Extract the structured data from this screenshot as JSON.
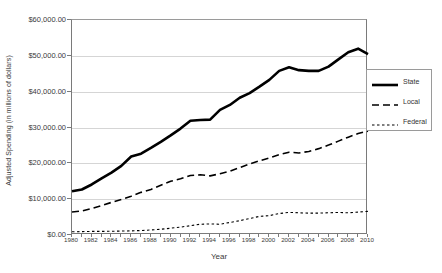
{
  "chart_data": {
    "type": "line",
    "title": "",
    "xlabel": "Year",
    "ylabel": "Adjusted Spending (in millions of dollars)",
    "xlim": [
      1980,
      2010
    ],
    "ylim": [
      0,
      60000
    ],
    "grid": true,
    "legend_position": "right",
    "y_tick_labels": [
      "$60,000.00",
      "$50,000.00",
      "$40,000.00",
      "$30,000.00",
      "$20,000.00",
      "$10,000.00",
      "$0.00"
    ],
    "y_tick_values": [
      60000,
      50000,
      40000,
      30000,
      20000,
      10000,
      0
    ],
    "x_tick_labels": [
      "1980",
      "1982",
      "1984",
      "1986",
      "1988",
      "1990",
      "1992",
      "1994",
      "1996",
      "1998",
      "2000",
      "2002",
      "2004",
      "2006",
      "2008",
      "2010"
    ],
    "x_tick_values": [
      1980,
      1982,
      1984,
      1986,
      1988,
      1990,
      1992,
      1994,
      1996,
      1998,
      2000,
      2002,
      2004,
      2006,
      2008,
      2010
    ],
    "x": [
      1980,
      1981,
      1982,
      1983,
      1984,
      1985,
      1986,
      1987,
      1988,
      1989,
      1990,
      1991,
      1992,
      1993,
      1994,
      1995,
      1996,
      1997,
      1998,
      1999,
      2000,
      2001,
      2002,
      2003,
      2004,
      2005,
      2006,
      2007,
      2008,
      2009,
      2010
    ],
    "series": [
      {
        "name": "State",
        "style": "solid",
        "color": "#000000",
        "width": 2.6,
        "values": [
          12200,
          12700,
          14100,
          15800,
          17400,
          19300,
          21900,
          22700,
          24300,
          26000,
          27800,
          29700,
          31900,
          32100,
          32200,
          34900,
          36300,
          38300,
          39600,
          41400,
          43300,
          45800,
          46800,
          46000,
          45800,
          45800,
          47000,
          49000,
          51000,
          52000,
          50500
        ]
      },
      {
        "name": "Local",
        "style": "dashed",
        "color": "#000000",
        "width": 1.6,
        "values": [
          6400,
          6700,
          7400,
          8200,
          9100,
          9900,
          10800,
          11900,
          12700,
          13900,
          15000,
          15700,
          16600,
          16800,
          16500,
          17100,
          17800,
          18800,
          19800,
          20700,
          21500,
          22400,
          23100,
          22900,
          23300,
          24100,
          25100,
          26200,
          27300,
          28300,
          29000
        ]
      },
      {
        "name": "Federal",
        "style": "dotted",
        "color": "#000000",
        "width": 1.1,
        "values": [
          900,
          950,
          1000,
          1000,
          1050,
          1100,
          1150,
          1250,
          1400,
          1600,
          1900,
          2200,
          2600,
          3000,
          3100,
          3000,
          3500,
          4000,
          4600,
          5200,
          5400,
          6000,
          6300,
          6200,
          6100,
          6100,
          6200,
          6300,
          6200,
          6400,
          6600
        ]
      }
    ]
  },
  "legend": {
    "items": [
      {
        "label": "State",
        "style": "solid"
      },
      {
        "label": "Local",
        "style": "dashed"
      },
      {
        "label": "Federal",
        "style": "dotted"
      }
    ]
  }
}
